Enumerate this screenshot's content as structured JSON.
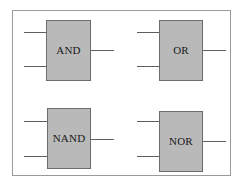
{
  "diagram": {
    "background_color": "#ffffff",
    "frame": {
      "border_color": "#9a9a9a",
      "fill_color": "#ffffff"
    },
    "gate_style": {
      "fill_color": "#b9b9b9",
      "border_color": "#6d6d6d",
      "label_color": "#1a1a1a",
      "wire_color": "#5e5e5e"
    },
    "gates": [
      {
        "id": "and",
        "label": "AND",
        "inputs": 2,
        "output": 1,
        "position": "top-left"
      },
      {
        "id": "or",
        "label": "OR",
        "inputs": 2,
        "output": 1,
        "position": "top-right"
      },
      {
        "id": "nand",
        "label": "NAND",
        "inputs": 2,
        "output": 1,
        "position": "bottom-left"
      },
      {
        "id": "nor",
        "label": "NOR",
        "inputs": 2,
        "output": 1,
        "position": "bottom-right"
      }
    ]
  }
}
